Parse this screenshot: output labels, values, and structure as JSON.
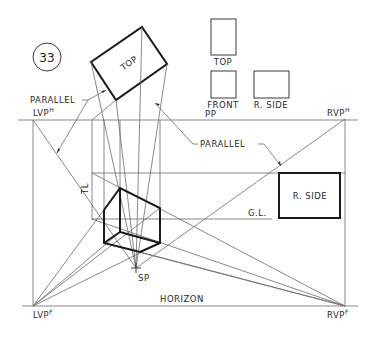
{
  "figure": {
    "number": "33",
    "labels": {
      "top": "TOP",
      "front": "FRONT",
      "r_side": "R. SIDE",
      "parallel": "PARALLEL",
      "pp": "PP",
      "horizon": "HORIZON",
      "gl": "G.L.",
      "tl": "TL",
      "sp": "SP",
      "lvp": "LVP",
      "rvp": "RVP",
      "sup_h": "H",
      "sup_f": "F"
    }
  }
}
